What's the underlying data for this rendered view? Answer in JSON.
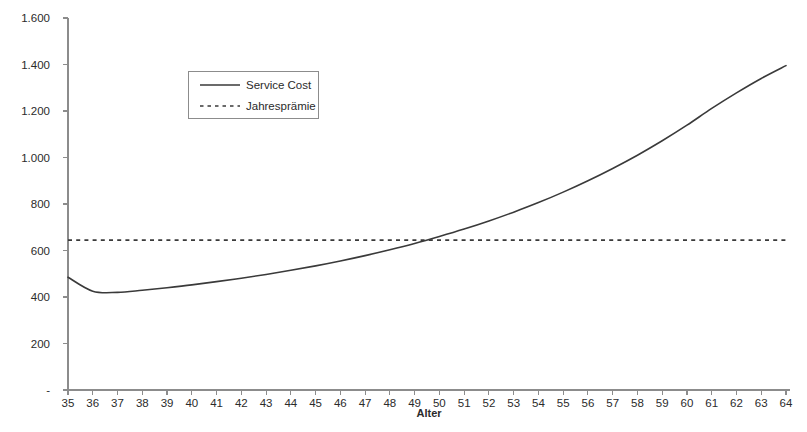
{
  "chart_data": {
    "type": "line",
    "title": "",
    "xlabel": "Alter",
    "ylabel": "",
    "xlim": [
      35,
      64
    ],
    "ylim": [
      0,
      1600
    ],
    "grid": false,
    "legend_position": "top-left-inside",
    "x": [
      35,
      36,
      37,
      38,
      39,
      40,
      41,
      42,
      43,
      44,
      45,
      46,
      47,
      48,
      49,
      50,
      51,
      52,
      53,
      54,
      55,
      56,
      57,
      58,
      59,
      60,
      61,
      62,
      63,
      64
    ],
    "x_tick_labels": [
      "35",
      "36",
      "37",
      "38",
      "39",
      "40",
      "41",
      "42",
      "43",
      "44",
      "45",
      "46",
      "47",
      "48",
      "49",
      "50",
      "51",
      "52",
      "53",
      "54",
      "55",
      "56",
      "57",
      "58",
      "59",
      "60",
      "61",
      "62",
      "63",
      "64"
    ],
    "y_ticks": [
      0,
      200,
      400,
      600,
      800,
      1000,
      1200,
      1400,
      1600
    ],
    "y_tick_labels": [
      "-",
      "200",
      "400",
      "600",
      "800",
      "1.000",
      "1.200",
      "1.400",
      "1.600"
    ],
    "series": [
      {
        "name": "Service Cost",
        "style": "solid",
        "color": "#3a3a3a",
        "values": [
          485,
          425,
          420,
          429,
          440,
          452,
          466,
          481,
          497,
          515,
          534,
          555,
          578,
          603,
          630,
          660,
          692,
          727,
          765,
          806,
          851,
          900,
          953,
          1010,
          1072,
          1139,
          1211,
          1278,
          1340,
          1395
        ]
      },
      {
        "name": "Jahresprämie",
        "style": "dashed",
        "color": "#3a3a3a",
        "values": [
          645,
          645,
          645,
          645,
          645,
          645,
          645,
          645,
          645,
          645,
          645,
          645,
          645,
          645,
          645,
          645,
          645,
          645,
          645,
          645,
          645,
          645,
          645,
          645,
          645,
          645,
          645,
          645,
          645,
          645
        ]
      }
    ],
    "annotations": {
      "crossover_age": 47.5,
      "crossover_value": 645,
      "minimum_age": 37,
      "minimum_value": 420
    }
  },
  "legend": {
    "items": [
      {
        "label": "Service Cost",
        "style": "solid"
      },
      {
        "label": "Jahresprämie",
        "style": "dashed"
      }
    ]
  },
  "axes": {
    "x_title": "Alter"
  }
}
